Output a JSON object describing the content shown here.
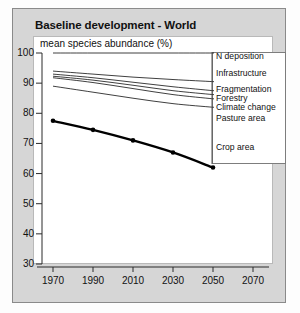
{
  "panel": {
    "title": "Baseline development - World",
    "subtitle": "mean species abundance (%)"
  },
  "chart_data": {
    "type": "line",
    "title": "Baseline development - World",
    "subtitle": "mean species abundance (%)",
    "xlabel": "",
    "ylabel": "mean species abundance (%)",
    "xlim": [
      1960,
      2080
    ],
    "ylim": [
      30,
      100
    ],
    "yticks": [
      30,
      40,
      50,
      60,
      70,
      80,
      90,
      100
    ],
    "xticks": [
      1970,
      1990,
      2010,
      2030,
      2050,
      2070
    ],
    "grid": false,
    "legend_position": "right-inline",
    "x": [
      1970,
      1990,
      2010,
      2030,
      2050
    ],
    "series": [
      {
        "name": "N deposition",
        "values": [
          100,
          100,
          100,
          100,
          100
        ],
        "style": "thin",
        "label": "N deposition"
      },
      {
        "name": "Infrastructure",
        "values": [
          94,
          93,
          92,
          91.2,
          90.5
        ],
        "style": "thin",
        "label": "Infrastructure"
      },
      {
        "name": "Fragmentation",
        "values": [
          93,
          91.8,
          90.3,
          88.8,
          87.5
        ],
        "style": "thin",
        "label": "Fragmentation"
      },
      {
        "name": "Forestry",
        "values": [
          92.3,
          91,
          89.3,
          87.5,
          86.2
        ],
        "style": "thin",
        "label": "Forestry"
      },
      {
        "name": "Climate change",
        "values": [
          91.8,
          90.2,
          88.2,
          86.2,
          84.8
        ],
        "style": "thin",
        "label": "Climate change"
      },
      {
        "name": "Pasture area",
        "values": [
          89,
          87,
          85,
          83.2,
          82
        ],
        "style": "thin",
        "label": "Pasture area"
      },
      {
        "name": "Crop area",
        "values": [
          77.5,
          74.5,
          71,
          67,
          62
        ],
        "style": "bold-markers",
        "label": "Crop area"
      }
    ]
  },
  "axes": {
    "y_ticks": [
      "100",
      "90",
      "80",
      "70",
      "60",
      "50",
      "40",
      "30"
    ],
    "x_ticks": [
      "1970",
      "1990",
      "2010",
      "2030",
      "2050",
      "2070"
    ]
  },
  "legend": {
    "items": [
      "N deposition",
      "Infrastructure",
      "Fragmentation",
      "Forestry",
      "Climate change",
      "Pasture area",
      "Crop area"
    ]
  }
}
